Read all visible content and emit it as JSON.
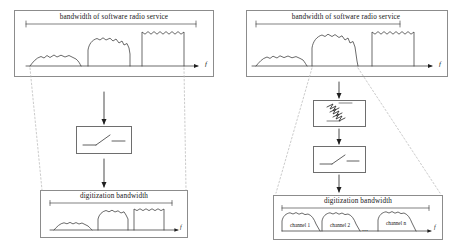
{
  "figure": {
    "background": "#ffffff",
    "line_color": "#2b2b2b",
    "panel_border": "#8c8c8c",
    "dashed_color": "#b0b0b0"
  },
  "left_branch": {
    "name": "wideband-digitization",
    "top_panel": {
      "caption": "bandwidth of software radio service",
      "axis_label": "f",
      "signals": [
        {
          "name": "signal-low-narrow",
          "shape": "rounded-hump",
          "x": 30,
          "width": 48,
          "height": 11
        },
        {
          "name": "signal-mid-wide",
          "shape": "rounded-hump",
          "x": 88,
          "width": 42,
          "height": 26
        },
        {
          "name": "signal-high-rect",
          "shape": "flat-top-rect",
          "x": 142,
          "width": 42,
          "height": 34
        }
      ]
    },
    "adc_box": {
      "name": "analog-to-digital-converter",
      "icon": "adc-ramp-icon"
    },
    "bottom_panel": {
      "caption": "digitization bandwidth",
      "axis_label": "f",
      "signals": [
        {
          "name": "signal-low-narrow",
          "shape": "rounded-hump"
        },
        {
          "name": "signal-mid-wide",
          "shape": "rounded-hump"
        },
        {
          "name": "signal-high-rect",
          "shape": "flat-top-rect"
        }
      ]
    }
  },
  "right_branch": {
    "name": "channelized-digitization",
    "top_panel": {
      "caption": "bandwidth of software radio service",
      "axis_label": "f",
      "signals": [
        {
          "name": "signal-low-narrow",
          "shape": "rounded-hump"
        },
        {
          "name": "signal-mid-wide",
          "shape": "rounded-hump"
        },
        {
          "name": "signal-high-rect",
          "shape": "flat-top-rect"
        }
      ]
    },
    "filter_box": {
      "name": "band-filter",
      "icon": "filter-waves-icon"
    },
    "adc_box": {
      "name": "analog-to-digital-converter",
      "icon": "adc-ramp-icon"
    },
    "bottom_panel": {
      "caption": "digitization bandwidth",
      "axis_label": "f",
      "channels": [
        {
          "label": "channel 1"
        },
        {
          "label": "channel 2"
        },
        {
          "label": "channel n"
        }
      ],
      "ellipsis": "⋯"
    }
  }
}
